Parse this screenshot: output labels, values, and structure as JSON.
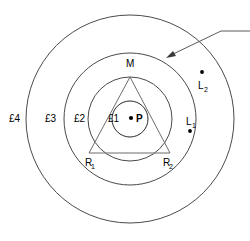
{
  "figure": {
    "background_color": "#ffffff",
    "line_color": "#4a4a4a",
    "text_color": "#000000",
    "width": 250,
    "height": 241
  },
  "zones": {
    "labels": [
      {
        "id": "e1",
        "text": "£1",
        "x": 113,
        "y": 122,
        "radius": 18
      },
      {
        "id": "e2",
        "text": "£2",
        "x": 88,
        "y": 122,
        "radius": 42
      },
      {
        "id": "e3",
        "text": "£3",
        "x": 63,
        "y": 122,
        "radius": 66
      },
      {
        "id": "e4",
        "text": "£4",
        "x": 9,
        "y": 122,
        "radius": 105
      }
    ],
    "center": {
      "x": 130,
      "y": 119
    }
  },
  "points": {
    "center_point": {
      "label": "P",
      "dot_x": 131,
      "dot_y": 118,
      "label_x": 136,
      "label_y": 122
    },
    "apex": {
      "label": "M",
      "x": 126,
      "y": 67
    },
    "base_left": {
      "label": "R",
      "sub": "1",
      "x": 85,
      "y": 166
    },
    "base_right": {
      "label": "R",
      "sub": "2",
      "x": 163,
      "y": 166
    },
    "outer_point_1": {
      "label": "L",
      "sub": "1",
      "label_x": 186,
      "label_y": 125,
      "dot_x": 190,
      "dot_y": 131
    },
    "outer_point_2": {
      "label": "L",
      "sub": "2",
      "label_x": 198,
      "label_y": 89,
      "dot_x": 202,
      "dot_y": 72
    }
  },
  "triangle": {
    "apex_x": 130,
    "apex_y": 77,
    "left_x": 89,
    "left_y": 153,
    "right_x": 170,
    "right_y": 153
  },
  "leader": {
    "arrow_x": 169,
    "arrow_y": 56,
    "bend_x": 221,
    "bend_y": 31,
    "end_x": 250,
    "end_y": 31,
    "caption": ""
  }
}
